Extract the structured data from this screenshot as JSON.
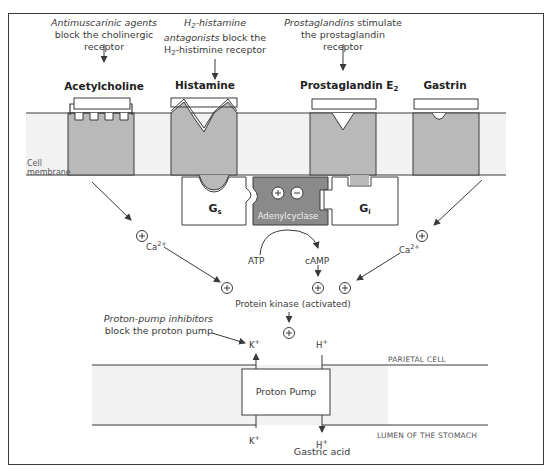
{
  "annotations": {
    "antimuscarinic": {
      "italic": "Antimuscarinic agents",
      "rest1": "block the cholinergic",
      "rest2": "receptor"
    },
    "h2_antagonists": {
      "italic_pre": "H",
      "italic_sub": "2",
      "italic_post": "-histamine",
      "italic2": "antagonists",
      "rest1": " block the",
      "line3_pre": "H",
      "line3_sub": "2",
      "line3_post": "-histimine receptor"
    },
    "prostaglandins": {
      "italic": "Prostaglandins",
      "rest1": " stimulate",
      "rest2": "the prostaglandin",
      "rest3": "receptor"
    },
    "ppi": {
      "italic": "Proton-pump inhibitors",
      "rest": "block the proton pump"
    }
  },
  "receptors": {
    "acetylcholine": "Acetylcholine",
    "histamine": "Histamine",
    "prostaglandin": "Prostaglandin E",
    "prostaglandin_sub": "2",
    "gastrin": "Gastrin"
  },
  "membrane_label": {
    "line1": "Cell",
    "line2": "membrane"
  },
  "g_proteins": {
    "gs": "G",
    "gs_sub": "s",
    "gi": "G",
    "gi_sub": "i"
  },
  "enzyme": {
    "label": "Adenylcyclase",
    "plus": "+",
    "minus": "−"
  },
  "molecules": {
    "atp": "ATP",
    "camp": "cAMP",
    "ca_left": "Ca",
    "ca_right": "Ca",
    "ca_charge": "2+",
    "protein_kinase": "Protein kinase (activated)",
    "k_top": "K",
    "h_top": "H",
    "k_bottom": "K",
    "h_bottom": "H",
    "ion_charge": "+",
    "gastric_acid": "Gastric acid",
    "plus_symbol": "+"
  },
  "pump": {
    "label": "Proton Pump"
  },
  "regions": {
    "parietal": "PARIETAL CELL",
    "lumen": "LUMEN OF THE STOMACH"
  },
  "colors": {
    "membrane": "#f2f2f2",
    "receptor": "#b9b9b9",
    "enzyme": "#8a8a8a",
    "stroke": "#3a3a3a"
  }
}
